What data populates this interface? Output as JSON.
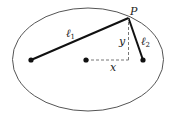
{
  "diagram": {
    "colors": {
      "background": "#ffffff",
      "ellipse_stroke": "#555555",
      "line": "#111111",
      "dashed": "#777777",
      "text": "#222222"
    },
    "ellipse": {
      "cx": 88,
      "cy": 59.5,
      "rx": 75.5,
      "ry": 51.5
    },
    "points": {
      "left_focus": {
        "x": 31,
        "y": 60
      },
      "center": {
        "x": 86,
        "y": 60
      },
      "right_focus": {
        "x": 143,
        "y": 60
      },
      "P": {
        "x": 128.5,
        "y": 18
      }
    },
    "labels": {
      "P": "P",
      "l1": "ℓ",
      "l1_sub": "1",
      "l2": "ℓ",
      "l2_sub": "2",
      "x": "x",
      "y": "y"
    }
  }
}
